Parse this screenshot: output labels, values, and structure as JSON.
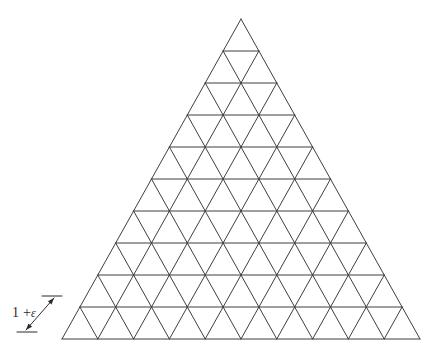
{
  "figure": {
    "type": "diagram",
    "canvas": {
      "width": 438,
      "height": 360,
      "background": "#ffffff"
    },
    "lattice": {
      "shape": "equilateral-triangle",
      "rows": 10,
      "small_triangles_total": 100,
      "upward_triangles": 55,
      "downward_triangles": 45,
      "apex": {
        "x": 241,
        "y": 19
      },
      "base_left": {
        "x": 62,
        "y": 339
      },
      "base_right": {
        "x": 420,
        "y": 339
      },
      "cell_side_px": 35.8,
      "row_height_px": 32.0,
      "line_color": "#3f3f3f",
      "line_width": 1
    },
    "annotation": {
      "label_prefix": "1 +",
      "label_symbol": "ε",
      "label_full": "1 + ε",
      "meaning": "side length of one lattice cell",
      "arrow": {
        "style": "double-headed",
        "from": {
          "x": 26,
          "y": 330
        },
        "to": {
          "x": 54,
          "y": 298
        },
        "tick_lower": {
          "x1": 17,
          "y1": 332,
          "x2": 37,
          "y2": 332
        },
        "tick_upper": {
          "x1": 42,
          "y1": 296,
          "x2": 62,
          "y2": 296
        },
        "color": "#2b2b2b"
      }
    }
  }
}
